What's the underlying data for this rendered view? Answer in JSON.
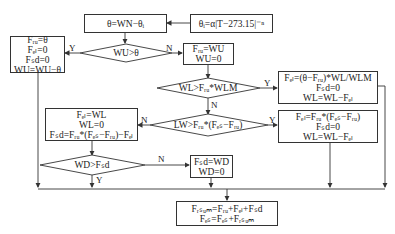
{
  "nodes": {
    "theta_calc": {
      "text": "θ=WN−θᵢ"
    },
    "theta_i": {
      "text": "θᵢ=α|T−273.15|⁻ⁿ"
    },
    "wu_check": {
      "text": "WU>θ"
    },
    "wu_yes_box": {
      "lines": [
        "Fᵣᵤ=θ",
        "Fₑₗ=0",
        "Fₛd=0",
        "WU=WU−θ"
      ]
    },
    "wu_no_box": {
      "lines": [
        "Fᵣᵤ=WU",
        "WU=0"
      ]
    },
    "wl_check": {
      "text": "WL>Fᵣᵤ*WLM"
    },
    "wl_yes_box": {
      "lines": [
        "Fₑₗ=(θ−Fᵣᵤ)*WL/WLM",
        "Fₛd=0",
        "WL=WL−Fₑₗ"
      ]
    },
    "lw_check": {
      "text": "LW>Fᵣᵤ*(Fₑₛ−Fᵣᵤ)"
    },
    "lw_yes_box": {
      "lines": [
        "Fₑₗ=Fᵣᵤ*(Fₑₛ−Fᵣᵤ)",
        "Fₛd=0",
        "WL=WL−Fₑₗ"
      ]
    },
    "lw_no_box": {
      "lines": [
        "Fₑₗ=WL",
        "WL=0",
        "Fₛd=Fᵣᵤ*(Fₑₛ−Fᵣᵤ)−Fₑₗ"
      ]
    },
    "wd_check": {
      "text": "WD>Fₛd"
    },
    "wd_no_box": {
      "lines": [
        "Fₛd=WD",
        "WD=0"
      ]
    },
    "final_box": {
      "lines": [
        "Fᵣₛᵤₘ=Fᵣᵤ+Fₑₗ+Fₛd",
        "Fₑₛ=Fₑₛ+Fᵣₛᵤₘ"
      ]
    }
  },
  "edge_labels": {
    "wu_yes": "Y",
    "wu_no": "N",
    "wl_yes": "Y",
    "wl_no": "N",
    "lw_yes": "Y",
    "lw_no": "N",
    "wd_no": "N",
    "wd_yes": "Y"
  },
  "colors": {
    "stroke": "#333333",
    "background": "#ffffff"
  }
}
